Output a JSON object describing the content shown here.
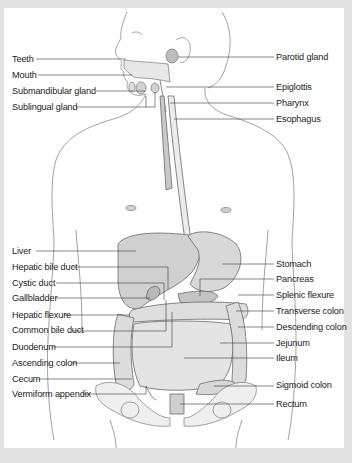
{
  "diagram": {
    "colors": {
      "background": "#e2e2e2",
      "panel": "#ffffff",
      "leader_line": "#3a3a3a",
      "label_text": "#1c1c1c",
      "outline": "#8a8a8a",
      "organ_fill": "#d6d6d6"
    },
    "left_labels": [
      {
        "text": "Teeth",
        "y": 59
      },
      {
        "text": "Mouth",
        "y": 75
      },
      {
        "text": "Submandibular gland",
        "y": 90
      },
      {
        "text": "Sublingual gland",
        "y": 107
      },
      {
        "text": "Liver",
        "y": 250
      },
      {
        "text": "Hepatic bile duct",
        "y": 267
      },
      {
        "text": "Cystic duct",
        "y": 283
      },
      {
        "text": "Gallbladder",
        "y": 298
      },
      {
        "text": "Hepatic flexure",
        "y": 315
      },
      {
        "text": "Common bile duct",
        "y": 330
      },
      {
        "text": "Duodenum",
        "y": 347
      },
      {
        "text": "Ascending colon",
        "y": 363
      },
      {
        "text": "Cecum",
        "y": 379
      },
      {
        "text": "Vermiform appendix",
        "y": 394
      }
    ],
    "right_labels": [
      {
        "text": "Parotid gland",
        "y": 57
      },
      {
        "text": "Epiglottis",
        "y": 87
      },
      {
        "text": "Pharynx",
        "y": 102
      },
      {
        "text": "Esophagus",
        "y": 119
      },
      {
        "text": "Stomach",
        "y": 263
      },
      {
        "text": "Pancreas",
        "y": 279
      },
      {
        "text": "Splenic flexure",
        "y": 295
      },
      {
        "text": "Transverse colon",
        "y": 311
      },
      {
        "text": "Descending colon",
        "y": 327
      },
      {
        "text": "Jejunum",
        "y": 343
      },
      {
        "text": "Ileum",
        "y": 358
      },
      {
        "text": "Sigmoid colon",
        "y": 385
      },
      {
        "text": "Rectum",
        "y": 404
      }
    ]
  }
}
